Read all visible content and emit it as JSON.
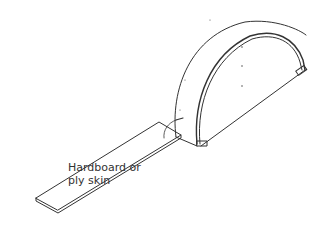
{
  "diagram": {
    "type": "technical-illustration",
    "callout": {
      "line1": "Hardboard or",
      "line2": "ply skin"
    },
    "colors": {
      "line": "#333333",
      "background": "#ffffff"
    }
  }
}
